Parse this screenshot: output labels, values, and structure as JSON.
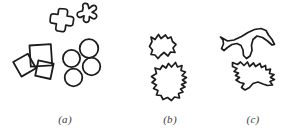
{
  "figure": {
    "background_color": "#ffffff",
    "stroke_color": "#1c1c1c",
    "width": 296,
    "height": 131,
    "panels": [
      {
        "id": "a",
        "caption": "(a)",
        "description": "simple geometric shapes",
        "shapes": [
          {
            "name": "cross-shape",
            "kind": "cross"
          },
          {
            "name": "star-shape",
            "kind": "star"
          },
          {
            "name": "square-upright-shape",
            "kind": "square"
          },
          {
            "name": "square-tilted-left-shape",
            "kind": "square"
          },
          {
            "name": "square-tilted-right-shape",
            "kind": "square"
          },
          {
            "name": "circle-shape-1",
            "kind": "circle"
          },
          {
            "name": "circle-shape-2",
            "kind": "circle"
          },
          {
            "name": "circle-shape-3",
            "kind": "circle"
          },
          {
            "name": "circle-shape-4",
            "kind": "circle"
          }
        ]
      },
      {
        "id": "b",
        "caption": "(b)",
        "description": "irregular blob outlines",
        "shapes": [
          {
            "name": "blob-shape-small",
            "kind": "blob"
          },
          {
            "name": "blob-shape-large",
            "kind": "blob"
          }
        ]
      },
      {
        "id": "c",
        "caption": "(c)",
        "description": "bird and airplane silhouettes",
        "shapes": [
          {
            "name": "airplane-silhouette-shape",
            "kind": "silhouette"
          },
          {
            "name": "bird-silhouette-shape",
            "kind": "silhouette"
          }
        ]
      }
    ]
  }
}
